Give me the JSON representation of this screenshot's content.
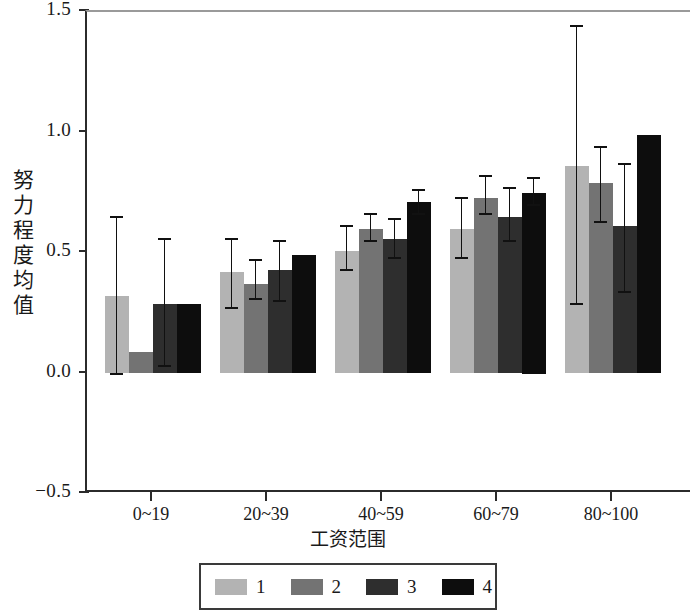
{
  "chart_data": {
    "type": "bar",
    "title": "",
    "subtitle": "",
    "xlabel": "工资范围",
    "ylabel": "努力程度均值",
    "ylabel_chars": [
      "努",
      "力",
      "程",
      "度",
      "均",
      "值"
    ],
    "categories": [
      "0~19",
      "20~39",
      "40~59",
      "60~79",
      "80~100"
    ],
    "ylim": [
      -0.5,
      1.5
    ],
    "yticks": [
      "1.5",
      "1.0",
      "0.5",
      "0.0",
      "−0.5"
    ],
    "ytick_values": [
      1.5,
      1.0,
      0.5,
      0.0,
      -0.5
    ],
    "grid": false,
    "legend_position": "bottom",
    "error_bars": "asymmetric-range",
    "series": [
      {
        "name": "1",
        "color": "#b3b3b3",
        "values": [
          0.32,
          0.42,
          0.51,
          0.6,
          0.86
        ],
        "err_low": [
          0.0,
          0.27,
          0.43,
          0.48,
          0.29
        ],
        "err_high": [
          0.65,
          0.56,
          0.61,
          0.73,
          1.44
        ]
      },
      {
        "name": "2",
        "color": "#737373",
        "values": [
          0.09,
          0.37,
          0.6,
          0.73,
          0.79
        ],
        "err_low": [
          null,
          0.31,
          0.55,
          0.66,
          0.63
        ],
        "err_high": [
          null,
          0.47,
          0.66,
          0.82,
          0.94
        ]
      },
      {
        "name": "3",
        "color": "#2e2e2e",
        "values": [
          0.29,
          0.43,
          0.56,
          0.65,
          0.61
        ],
        "err_low": [
          0.03,
          0.3,
          0.48,
          0.55,
          0.34
        ],
        "err_high": [
          0.56,
          0.55,
          0.64,
          0.77,
          0.87
        ]
      },
      {
        "name": "4",
        "color": "#0d0d0d",
        "values": [
          0.29,
          0.49,
          0.71,
          0.75,
          0.99
        ],
        "err_low": [
          null,
          null,
          0.66,
          0.7,
          null
        ],
        "err_high": [
          null,
          null,
          0.76,
          0.81,
          null
        ]
      }
    ]
  },
  "legend": {
    "entries": [
      {
        "label": "1",
        "color": "#b3b3b3"
      },
      {
        "label": "2",
        "color": "#737373"
      },
      {
        "label": "3",
        "color": "#2e2e2e"
      },
      {
        "label": "4",
        "color": "#0d0d0d"
      }
    ]
  },
  "axis_color": "#2b2b2b",
  "error_bar_color": "#111111"
}
